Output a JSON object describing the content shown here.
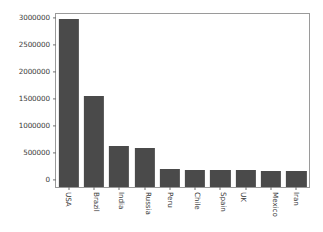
{
  "chart_data": {
    "type": "bar",
    "title": "",
    "xlabel": "",
    "ylabel": "",
    "categories": [
      "USA",
      "Brazil",
      "India",
      "Russia",
      "Peru",
      "Chile",
      "Spain",
      "UK",
      "Mexico",
      "Iran"
    ],
    "values": [
      3100000,
      1690000,
      760000,
      715000,
      330000,
      322000,
      318000,
      310000,
      300000,
      290000
    ],
    "ylim": [
      0,
      3200000
    ],
    "yticks": [
      0,
      500000,
      1000000,
      1500000,
      2000000,
      2500000,
      3000000
    ],
    "ytick_labels": [
      "0",
      "500000",
      "1000000",
      "1500000",
      "2000000",
      "2500000",
      "3000000"
    ],
    "grid": false,
    "legend": null,
    "bar_color": "#4a4a4a",
    "frame_color": "#9a9a9a",
    "background_color": "#ffffff",
    "xtick_label_rotation": 90
  }
}
